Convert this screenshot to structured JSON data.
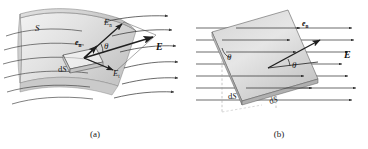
{
  "figure": {
    "panels": [
      {
        "id": "a",
        "caption": "(a)",
        "description": "Curved surface S with element dS, field vector E decomposed into normal component En and tangential component Et, angle theta between e_n and E",
        "labels": {
          "surface": "S",
          "area_element": "dS",
          "unit_normal": "e",
          "unit_normal_sub": "n",
          "field": "E",
          "normal_component": "E",
          "normal_component_sub": "n",
          "tangential_component": "E",
          "tangential_component_sub": "t",
          "angle": "θ"
        }
      },
      {
        "id": "b",
        "caption": "(b)",
        "description": "Tilted flat plate dS in a uniform field E, unit normal e_n at angle theta to E, projected area dS shown with dashed construction lines",
        "labels": {
          "unit_normal": "e",
          "unit_normal_sub": "n",
          "field": "E",
          "angle_left": "θ",
          "angle_right": "θ",
          "projected_area": "dS",
          "plate_area": "dS"
        }
      }
    ],
    "colors": {
      "background": "#ffffff",
      "ink": "#1a1a1a",
      "surface_fill_light": "#efefef",
      "surface_fill_mid": "#d9d9d9",
      "surface_fill_dark": "#c2c2c2",
      "plate_fill": "#d5d5d5",
      "field_line": "#2b2b2b",
      "construction_dash": "#9a9a9a"
    }
  }
}
